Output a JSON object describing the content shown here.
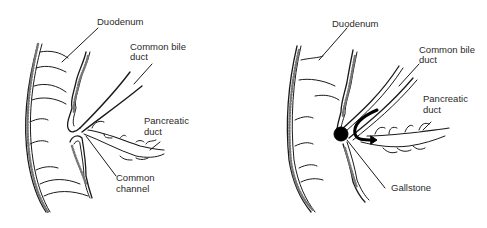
{
  "diagram": {
    "type": "anatomical-illustration",
    "panels": [
      {
        "id": "normal",
        "labels": {
          "duodenum": "Duodenum",
          "common_bile_duct_1": "Common bile",
          "common_bile_duct_2": "duct",
          "pancreatic_duct_1": "Pancreatic",
          "pancreatic_duct_2": "duct",
          "common_channel_1": "Common",
          "common_channel_2": "channel"
        }
      },
      {
        "id": "gallstone-obstruction",
        "labels": {
          "duodenum": "Duodenum",
          "common_bile_duct_1": "Common bile",
          "common_bile_duct_2": "duct",
          "pancreatic_duct_1": "Pancreatic",
          "pancreatic_duct_2": "duct",
          "gallstone": "Gallstone"
        }
      }
    ],
    "colors": {
      "line": "#1a1a1a",
      "background": "#ffffff",
      "stone": "#000000"
    }
  }
}
